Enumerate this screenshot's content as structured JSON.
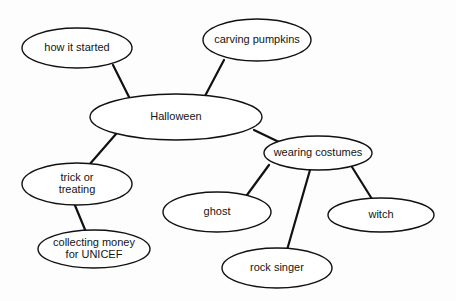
{
  "diagram": {
    "type": "mind-map",
    "background_color": "#fdfdfd",
    "stroke_color": "#111111",
    "text_color": "#141414",
    "nodes": [
      {
        "id": "halloween",
        "label": "Halloween",
        "lines": [
          "Halloween"
        ],
        "role": "root",
        "cx": 176,
        "cy": 117,
        "rx": 86,
        "ry": 23
      },
      {
        "id": "how-it-started",
        "label": "how it started",
        "lines": [
          "how it started"
        ],
        "role": "branch",
        "cx": 77,
        "cy": 48,
        "rx": 55,
        "ry": 20
      },
      {
        "id": "carving-pumpkins",
        "label": "carving pumpkins",
        "lines": [
          "carving pumpkins"
        ],
        "role": "branch",
        "cx": 257,
        "cy": 40,
        "rx": 54,
        "ry": 21
      },
      {
        "id": "trick-or-treating",
        "label": "trick or treating",
        "lines": [
          "trick or",
          "treating"
        ],
        "role": "branch",
        "cx": 77,
        "cy": 184,
        "rx": 55,
        "ry": 21
      },
      {
        "id": "collecting-money-for-unicef",
        "label": "collecting money for UNICEF",
        "lines": [
          "collecting money",
          "for UNICEF"
        ],
        "role": "leaf",
        "cx": 94,
        "cy": 249,
        "rx": 56,
        "ry": 19
      },
      {
        "id": "wearing-costumes",
        "label": "wearing costumes",
        "lines": [
          "wearing costumes"
        ],
        "role": "branch",
        "cx": 318,
        "cy": 153,
        "rx": 54,
        "ry": 17
      },
      {
        "id": "ghost",
        "label": "ghost",
        "lines": [
          "ghost"
        ],
        "role": "leaf",
        "cx": 217,
        "cy": 212,
        "rx": 54,
        "ry": 20
      },
      {
        "id": "rock-singer",
        "label": "rock singer",
        "lines": [
          "rock singer"
        ],
        "role": "leaf",
        "cx": 277,
        "cy": 268,
        "rx": 55,
        "ry": 20
      },
      {
        "id": "witch",
        "label": "witch",
        "lines": [
          "witch"
        ],
        "role": "leaf",
        "cx": 381,
        "cy": 215,
        "rx": 53,
        "ry": 17
      }
    ],
    "edges": [
      {
        "id": "edge-how-it-started",
        "from": "how-it-started",
        "to": "halloween",
        "x1": 113,
        "y1": 65,
        "x2": 129,
        "y2": 97
      },
      {
        "id": "edge-carving-pumpkins",
        "from": "carving-pumpkins",
        "to": "halloween",
        "x1": 224,
        "y1": 60,
        "x2": 205,
        "y2": 96
      },
      {
        "id": "edge-trick-or-treating",
        "from": "halloween",
        "to": "trick-or-treating",
        "x1": 116,
        "y1": 134,
        "x2": 89,
        "y2": 165
      },
      {
        "id": "edge-collecting-money",
        "from": "trick-or-treating",
        "to": "collecting-money-for-unicef",
        "x1": 74,
        "y1": 203,
        "x2": 86,
        "y2": 232
      },
      {
        "id": "edge-wearing-costumes",
        "from": "halloween",
        "to": "wearing-costumes",
        "x1": 254,
        "y1": 130,
        "x2": 279,
        "y2": 142
      },
      {
        "id": "edge-ghost",
        "from": "wearing-costumes",
        "to": "ghost",
        "x1": 269,
        "y1": 165,
        "x2": 247,
        "y2": 195
      },
      {
        "id": "edge-rock-singer",
        "from": "wearing-costumes",
        "to": "rock-singer",
        "x1": 310,
        "y1": 170,
        "x2": 287,
        "y2": 250
      },
      {
        "id": "edge-witch",
        "from": "wearing-costumes",
        "to": "witch",
        "x1": 352,
        "y1": 167,
        "x2": 372,
        "y2": 199
      }
    ]
  }
}
